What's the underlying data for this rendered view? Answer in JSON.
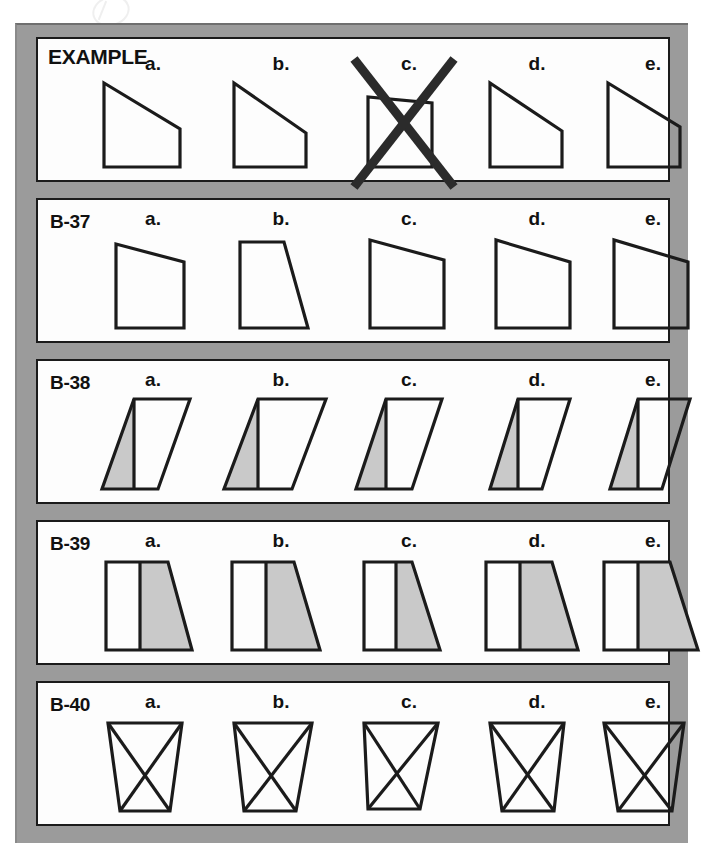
{
  "worksheet": {
    "title_row_label": "EXAMPLE",
    "option_letters": [
      "a.",
      "b.",
      "c.",
      "d.",
      "e."
    ],
    "ink_color": "#1b1b1b",
    "shade_color": "#c9c9c9",
    "frame_color": "#9b9b9b",
    "panel_color": "#fdfdfd",
    "crossout_color": "#2b2b2b"
  },
  "rows": [
    {
      "label": "EXAMPLE",
      "kind": "example",
      "crossed_out_option": "c.",
      "shape_type": "right-trapezoid",
      "options": [
        {
          "letter": "a.",
          "shape": "right-trapezoid",
          "points": "10,8 10,92 86,92 86,54",
          "shaded": false
        },
        {
          "letter": "b.",
          "shape": "right-trapezoid",
          "points": "12,8 12,92 84,92 84,58",
          "shaded": false
        },
        {
          "letter": "c.",
          "shape": "right-trapezoid",
          "points": "18,22 18,92 82,92 82,28",
          "shaded": false,
          "crossed_out": true
        },
        {
          "letter": "d.",
          "shape": "right-trapezoid",
          "points": "12,8 12,92 84,92 84,56",
          "shaded": false
        },
        {
          "letter": "e.",
          "shape": "right-trapezoid",
          "points": "14,8 14,92 86,92 86,52",
          "shaded": false
        }
      ]
    },
    {
      "label": "B-37",
      "kind": "question",
      "shape_type": "quadrilateral",
      "options": [
        {
          "letter": "a.",
          "shape": "quadrilateral",
          "points": "22,14 22,98 90,98 90,32",
          "shaded": false
        },
        {
          "letter": "b.",
          "shape": "quadrilateral",
          "points": "18,12 18,98 86,98 62,12",
          "shaded": false
        },
        {
          "letter": "c.",
          "shape": "quadrilateral",
          "points": "20,10 20,98 94,98 94,30",
          "shaded": false
        },
        {
          "letter": "d.",
          "shape": "quadrilateral",
          "points": "18,10 18,98 92,98 92,32",
          "shaded": false
        },
        {
          "letter": "e.",
          "shape": "quadrilateral",
          "points": "20,10 20,98 94,98 94,32",
          "shaded": false
        }
      ]
    },
    {
      "label": "B-38",
      "kind": "question",
      "shape_type": "parallelogram-with-shaded-triangle",
      "options": [
        {
          "letter": "a.",
          "outline": "40,8 96,8 64,98 8,98",
          "divider": "40,8 40,98",
          "shaded_triangle": "40,8 40,98 8,98",
          "shaded": true
        },
        {
          "letter": "b.",
          "outline": "36,8 104,8 70,98 2,98",
          "divider": "36,8 36,98",
          "shaded_triangle": "36,8 36,98 2,98",
          "shaded": true
        },
        {
          "letter": "c.",
          "outline": "36,8 92,8 62,98 6,98",
          "divider": "36,8 36,98",
          "shaded_triangle": "36,8 36,98 6,98",
          "shaded": true
        },
        {
          "letter": "d.",
          "outline": "40,8 92,8 64,98 12,98",
          "divider": "40,8 40,98",
          "shaded_triangle": "40,8 40,98 12,98",
          "shaded": true
        },
        {
          "letter": "e.",
          "outline": "44,8 96,8 68,98 16,98",
          "divider": "44,8 44,98",
          "shaded_triangle": "44,8 44,98 16,98",
          "shaded": true
        }
      ]
    },
    {
      "label": "B-39",
      "kind": "question",
      "shape_type": "trapezoid-split-vertical-shaded-right",
      "options": [
        {
          "letter": "a.",
          "outline": "12,10 74,10 98,98 12,98",
          "divider": "46,10 46,98",
          "shaded_region": "46,10 74,10 98,98 46,98",
          "shaded": true
        },
        {
          "letter": "b.",
          "outline": "10,10 72,10 98,98 10,98",
          "divider": "44,10 44,98",
          "shaded_region": "44,10 72,10 98,98 44,98",
          "shaded": true
        },
        {
          "letter": "c.",
          "outline": "14,10 62,10 90,98 14,98",
          "divider": "46,10 46,98",
          "shaded_region": "46,10 62,10 90,98 46,98",
          "shaded": true
        },
        {
          "letter": "d.",
          "outline": "8,10 74,10 100,98 8,98",
          "divider": "42,10 42,98",
          "shaded_region": "42,10 74,10 100,98 42,98",
          "shaded": true
        },
        {
          "letter": "e.",
          "outline": "10,10 76,10 104,98 10,98",
          "divider": "44,10 44,98",
          "shaded_region": "44,10 76,10 104,98 44,98",
          "shaded": true
        }
      ]
    },
    {
      "label": "B-40",
      "kind": "question",
      "shape_type": "quadrilateral-with-both-diagonals",
      "options": [
        {
          "letter": "a.",
          "outline": "14,10 88,10 76,98 26,98",
          "diagonal1": "14,10 76,98",
          "diagonal2": "88,10 26,98",
          "shaded": false
        },
        {
          "letter": "b.",
          "outline": "12,10 90,10 74,98 22,98",
          "diagonal1": "12,10 74,98",
          "diagonal2": "90,10 22,98",
          "shaded": false
        },
        {
          "letter": "c.",
          "outline": "14,10 88,10 70,96 18,96",
          "diagonal1": "14,10 70,96",
          "diagonal2": "88,10 18,96",
          "shaded": false
        },
        {
          "letter": "d.",
          "outline": "12,10 86,10 76,98 24,98",
          "diagonal1": "12,10 76,98",
          "diagonal2": "86,10 24,98",
          "shaded": false
        },
        {
          "letter": "e.",
          "outline": "10,10 90,10 78,98 24,98",
          "diagonal1": "10,10 78,98",
          "diagonal2": "90,10 24,98",
          "shaded": false
        }
      ]
    }
  ]
}
